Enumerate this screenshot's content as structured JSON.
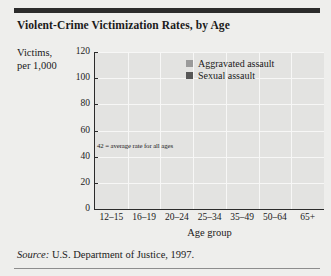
{
  "figure": {
    "title": "Violent-Crime Victimization Rates, by Age",
    "source_prefix": "Source:",
    "source_text": "U.S. Department of Justice, 1997."
  },
  "chart_data": {
    "type": "line",
    "title": "Violent-Crime Victimization Rates, by Age",
    "xlabel": "Age group",
    "ylabel": "Victims, per 1,000",
    "ylabel_line1": "Victims,",
    "ylabel_line2": "per 1,000",
    "categories": [
      "12–15",
      "16–19",
      "20–24",
      "25–34",
      "35–49",
      "50–64",
      "65+"
    ],
    "ylim": [
      0,
      120
    ],
    "yticks": [
      0,
      20,
      40,
      60,
      80,
      100,
      120
    ],
    "grid": true,
    "legend_position": "top-right",
    "series": [
      {
        "name": "Aggravated assault",
        "color": "#9a9a9a",
        "values": [
          94,
          103,
          79,
          57,
          39,
          21,
          4
        ]
      },
      {
        "name": "Sexual assault",
        "color": "#575757",
        "values": [
          16,
          26,
          21,
          16,
          12,
          8,
          3
        ]
      }
    ],
    "annotations": [
      {
        "name": "average-rate-line",
        "text": "42 = average rate for all ages",
        "value": 42,
        "color": "#2b2b2b"
      }
    ]
  }
}
